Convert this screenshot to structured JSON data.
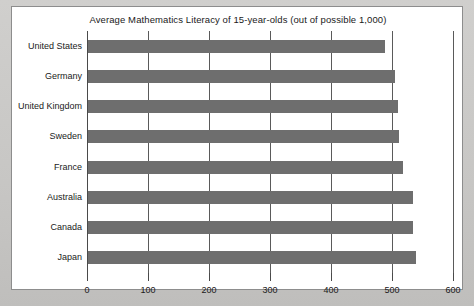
{
  "chart_data": {
    "type": "bar",
    "orientation": "horizontal",
    "title": "Average Mathematics Literacy of 15-year-olds (out of possible 1,000)",
    "xlabel": "",
    "ylabel": "",
    "categories": [
      "United States",
      "Germany",
      "United Kingdom",
      "Sweden",
      "France",
      "Australia",
      "Canada",
      "Japan"
    ],
    "values": [
      487,
      503,
      508,
      510,
      517,
      533,
      533,
      537
    ],
    "xlim": [
      0,
      600
    ],
    "xticks": [
      0,
      100,
      200,
      300,
      400,
      500,
      600
    ],
    "xtick_labels": [
      "0",
      "100",
      "200",
      "300",
      "400",
      "500",
      "600"
    ],
    "grid": true,
    "grid_axis": "x",
    "legend": false,
    "bar_color": "#6e6e6e",
    "plot_background": "#ffffff",
    "axis_color": "#4a4a4a",
    "page_background": "#c9c9c7"
  }
}
